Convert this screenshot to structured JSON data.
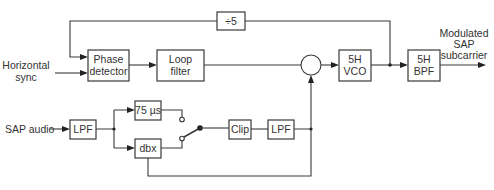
{
  "diagram": {
    "inputs": {
      "horizontal_sync": [
        "Horizontal",
        "sync"
      ],
      "sap_audio": "SAP audio"
    },
    "output": [
      "Modulated",
      "SAP",
      "subcarrier"
    ],
    "blocks": {
      "divider": "÷5",
      "phase_detector": [
        "Phase",
        "detector"
      ],
      "loop_filter": [
        "Loop",
        "filter"
      ],
      "vco": [
        "5H",
        "VCO"
      ],
      "bpf": [
        "5H",
        "BPF"
      ],
      "lpf_in": "LPF",
      "preemphasis": "75 µs",
      "dbx": "dbx",
      "clip": "Clip",
      "lpf_out": "LPF"
    },
    "colors": {
      "line": "#3a3a3a",
      "text": "#333333",
      "background": "#ffffff"
    }
  }
}
